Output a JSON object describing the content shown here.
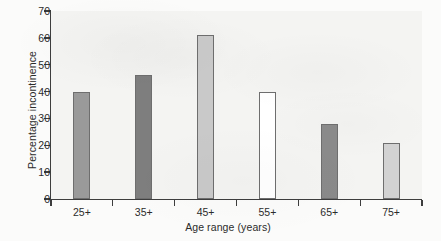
{
  "chart_data": {
    "type": "bar",
    "title": "",
    "subtitle": "",
    "xlabel": "Age range (years)",
    "ylabel": "Percentage incontinence",
    "categories": [
      "25+",
      "35+",
      "45+",
      "55+",
      "65+",
      "75+"
    ],
    "values": [
      40,
      46,
      61,
      40,
      28,
      21
    ],
    "bar_colors": [
      "#9a9a9a",
      "#7e7e7e",
      "#c9c9c9",
      "#ffffff",
      "#8a8a8a",
      "#d2d2d2"
    ],
    "bar_edge_color": "#6e6e6e",
    "ylim": [
      0,
      70
    ],
    "yticks": [
      0,
      10,
      20,
      30,
      40,
      50,
      60,
      70
    ],
    "ytick_labels": [
      "0",
      "10",
      "20",
      "30",
      "40",
      "50",
      "60",
      "70"
    ],
    "xtick_labels": [
      "25+",
      "35+",
      "45+",
      "55+",
      "65+",
      "75+"
    ],
    "grid": false,
    "legend": false,
    "legend_position": "none",
    "plot_background": "#f4f4f2",
    "figure_background": "#fbfbfa",
    "axis_color": "#3d3d3d",
    "text_color": "#2b2b2b",
    "annotations": []
  }
}
